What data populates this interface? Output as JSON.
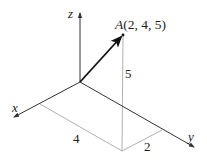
{
  "diagram": {
    "type": "3d-coordinate-vector",
    "axes": {
      "x_label": "x",
      "y_label": "y",
      "z_label": "z"
    },
    "point": {
      "name": "A",
      "coords_text": "(2, 4, 5)",
      "coords": [
        2,
        4,
        5
      ]
    },
    "dimension_labels": {
      "x_component": "4",
      "y_component": "2",
      "z_component": "5"
    },
    "colors": {
      "axis": "#333333",
      "guide": "#999999",
      "vector": "#111111"
    }
  }
}
